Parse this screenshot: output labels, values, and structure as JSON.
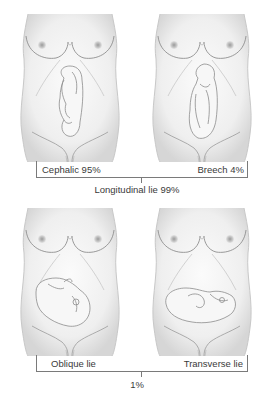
{
  "diagram": {
    "panels": [
      {
        "id": "cephalic",
        "label": "Cephalic 95%"
      },
      {
        "id": "breech",
        "label": "Breech 4%"
      },
      {
        "id": "oblique",
        "label": "Oblique lie"
      },
      {
        "id": "transverse",
        "label": "Transverse lie"
      }
    ],
    "groups": [
      {
        "label": "Longitudinal lie 99%",
        "members": [
          "cephalic",
          "breech"
        ]
      },
      {
        "label": "1%",
        "members": [
          "oblique",
          "transverse"
        ]
      }
    ],
    "colors": {
      "skin": "#f2f2f2",
      "skin_shade": "#d9d9d9",
      "outline": "#9a9a9a",
      "fetus_outline": "#8c8c8c",
      "bracket": "#7a7a7a",
      "text": "#3a3a3a"
    }
  }
}
